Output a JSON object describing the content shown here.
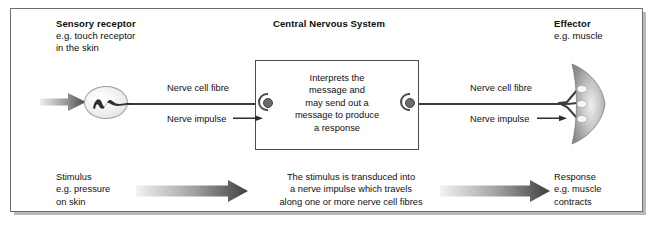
{
  "diagram": {
    "headers": {
      "sensory": {
        "title": "Sensory receptor",
        "sub_line1": "e.g. touch receptor",
        "sub_line2": "in the skin"
      },
      "cns": {
        "title": "Central Nervous System",
        "sub_line1": "",
        "sub_line2": ""
      },
      "effector": {
        "title": "Effector",
        "sub_line1": "e.g. muscle",
        "sub_line2": ""
      }
    },
    "cns_box": {
      "line1": "Interprets the",
      "line2": "message and",
      "line3": "may send out a",
      "line4": "message to produce",
      "line5": "a response"
    },
    "labels": {
      "fibre_left": "Nerve cell fibre",
      "impulse_left": "Nerve impulse",
      "fibre_right": "Nerve cell fibre",
      "impulse_right": "Nerve impulse"
    },
    "bottom": {
      "stimulus": {
        "line1": "Stimulus",
        "line2": "e.g. pressure",
        "line3": "on skin"
      },
      "middle": {
        "line1": "The stimulus is transduced into",
        "line2": "a nerve impulse which travels",
        "line3": "along one or more nerve cell fibres"
      },
      "response": {
        "line1": "Response",
        "line2": "e.g. muscle",
        "line3": "contracts"
      }
    },
    "colors": {
      "frame_border": "#6f6f6f",
      "cns_border": "#4c4c4c",
      "nerve": "#3c3c3c",
      "synapse_fill": "#6b6b6b",
      "muscle_dark": "#8f8f8f",
      "arrow_dark": "#4a4a4a",
      "arrow_light": "#e8e8e8",
      "text": "#111111",
      "background": "#ffffff"
    }
  }
}
